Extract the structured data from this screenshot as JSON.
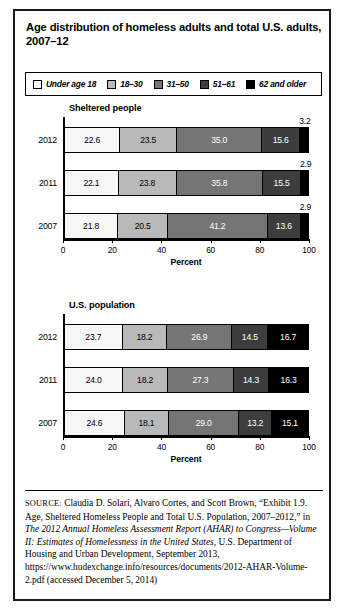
{
  "figure": {
    "title": "Age distribution of homeless adults and total U.S. adults, 2007–12"
  },
  "legend": {
    "items": [
      {
        "label": "Under age 18",
        "color": "#f7f7f7"
      },
      {
        "label": "18–30",
        "color": "#b9b9b9"
      },
      {
        "label": "31–50",
        "color": "#757575"
      },
      {
        "label": "51–61",
        "color": "#3d3d3d"
      },
      {
        "label": "62 and older",
        "color": "#000000"
      }
    ]
  },
  "chart_data": [
    {
      "type": "bar",
      "orientation": "horizontal",
      "stacked": true,
      "title": "Sheltered people",
      "xlabel": "Percent",
      "ylabel": "",
      "xlim": [
        0,
        100
      ],
      "xticks": [
        0,
        20,
        40,
        60,
        80,
        100
      ],
      "grid": false,
      "legend_position": "top",
      "categories": [
        "2012",
        "2011",
        "2007"
      ],
      "series": [
        {
          "name": "Under age 18",
          "values": [
            22.6,
            22.1,
            21.8
          ]
        },
        {
          "name": "18–30",
          "values": [
            23.5,
            23.8,
            20.5
          ]
        },
        {
          "name": "31–50",
          "values": [
            35.0,
            35.8,
            41.2
          ]
        },
        {
          "name": "51–61",
          "values": [
            15.6,
            15.5,
            13.6
          ]
        },
        {
          "name": "62 and older",
          "values": [
            3.2,
            2.9,
            2.9
          ]
        }
      ]
    },
    {
      "type": "bar",
      "orientation": "horizontal",
      "stacked": true,
      "title": "U.S. population",
      "xlabel": "Percent",
      "ylabel": "",
      "xlim": [
        0,
        100
      ],
      "xticks": [
        0,
        20,
        40,
        60,
        80,
        100
      ],
      "grid": false,
      "legend_position": "top",
      "categories": [
        "2012",
        "2011",
        "2007"
      ],
      "series": [
        {
          "name": "Under age 18",
          "values": [
            23.7,
            24.0,
            24.6
          ]
        },
        {
          "name": "18–30",
          "values": [
            18.2,
            18.2,
            18.1
          ]
        },
        {
          "name": "31–50",
          "values": [
            26.9,
            27.3,
            29.0
          ]
        },
        {
          "name": "51–61",
          "values": [
            14.5,
            14.3,
            13.2
          ]
        },
        {
          "name": "62 and older",
          "values": [
            16.7,
            16.3,
            15.1
          ]
        }
      ]
    }
  ],
  "source": {
    "label": "SOURCE:",
    "text_part1": " Claudia D. Solari, Alvaro Cortes, and Scott Brown, “Exhibit 1.9. Age, Sheltered Homeless People and Total U.S. Population, 2007–2012,” in ",
    "italic1": "The 2012 Annual Homeless Assessment Report (AHAR) to Congress—Volume II: Estimates of Homelessness in the United States",
    "text_part2": ", U.S. Department of Housing and Urban Development, September 2013, https://www.hudexchange.info/resources/documents/2012-AHAR-Volume-2.pdf (accessed December 5, 2014)"
  }
}
